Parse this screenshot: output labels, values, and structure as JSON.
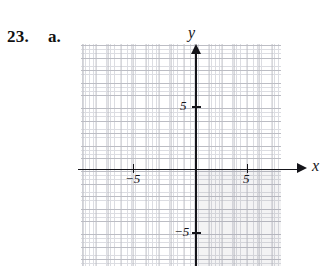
{
  "problem": {
    "number": "23.",
    "part": "a."
  },
  "chart_data": {
    "type": "scatter",
    "title": "",
    "xlabel": "x",
    "ylabel": "y",
    "xlim": [
      -9,
      7
    ],
    "ylim": [
      -8,
      9
    ],
    "grid": true,
    "legend": null,
    "axis_labels": {
      "x": "x",
      "y": "y"
    },
    "x_ticks": [
      {
        "value": -5,
        "label": "−5"
      },
      {
        "value": 5,
        "label": "5"
      }
    ],
    "y_ticks": [
      {
        "value": 5,
        "label": "5"
      },
      {
        "value": -5,
        "label": "−5"
      }
    ],
    "gridline_spacing": {
      "minor": 0.333,
      "major": 1
    },
    "shaded_regions": [
      {
        "name": "quadrant-iv-shading",
        "x_range": [
          0,
          7
        ],
        "y_range": [
          -8,
          0
        ],
        "color": "#78788015"
      }
    ],
    "series": [],
    "values": [],
    "categories": []
  },
  "colors": {
    "axis": "#15151a",
    "grid_minor": "#dcdde2",
    "grid_major": "#bcbdc4",
    "text": "#111111",
    "shading": "rgba(120,120,128,0.085)",
    "background": "#ffffff"
  }
}
